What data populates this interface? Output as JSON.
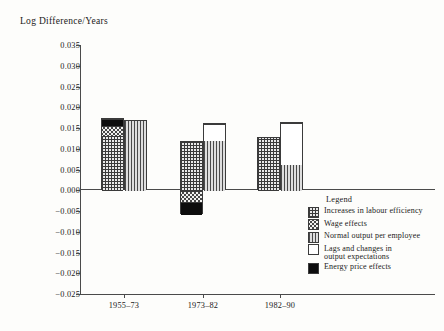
{
  "chart_data": {
    "type": "bar",
    "title": "Log Difference/Years",
    "subtitle": "",
    "xlabel": "",
    "ylabel": "Log Difference/Years",
    "grid": false,
    "stacked": true,
    "legend_position": "inside-bottom-right",
    "ylim": [
      -0.025,
      0.035
    ],
    "ytick_labels": [
      "0.035",
      "0.030",
      "0.025",
      "0.020",
      "0.015",
      "0.010",
      "0.005",
      "0.000",
      "−0.005",
      "−0.010",
      "−0.015",
      "−0.020",
      "−0.025"
    ],
    "ytick_values": [
      0.035,
      0.03,
      0.025,
      0.02,
      0.015,
      0.01,
      0.005,
      0.0,
      -0.005,
      -0.01,
      -0.015,
      -0.02,
      -0.025
    ],
    "categories": [
      "1955–73",
      "1973–82",
      "1982–90"
    ],
    "series": [
      {
        "name": "Increases in labour efficiency",
        "pattern": "grid",
        "values": [
          0.0133,
          0.0118,
          0.0128
        ]
      },
      {
        "name": "Wage effects",
        "pattern": "dots",
        "values": [
          0.0024,
          -0.0027,
          0.0
        ]
      },
      {
        "name": "Normal output per employee",
        "pattern": "vertical-lines",
        "values": [
          0.017,
          0.012,
          0.0063
        ]
      },
      {
        "name": "Lags and changes in output expectations",
        "pattern": "white",
        "values": [
          0.0,
          0.0043,
          0.0102
        ]
      },
      {
        "name": "Energy price effects",
        "pattern": "black",
        "values": [
          0.0018,
          -0.003,
          0.0
        ]
      }
    ],
    "bars": [
      {
        "group": "1955–73",
        "left_bar": {
          "segments": [
            {
              "series": "Increases in labour efficiency",
              "from": 0.0,
              "to": 0.0133
            },
            {
              "series": "Wage effects",
              "from": 0.0133,
              "to": 0.0157
            },
            {
              "series": "Energy price effects",
              "from": 0.0157,
              "to": 0.0175
            }
          ]
        },
        "right_bar": {
          "segments": [
            {
              "series": "Normal output per employee",
              "from": 0.0,
              "to": 0.017
            }
          ]
        }
      },
      {
        "group": "1973–82",
        "left_bar": {
          "segments": [
            {
              "series": "Increases in labour efficiency",
              "from": 0.0,
              "to": 0.0118
            },
            {
              "series": "Wage effects",
              "from": -0.0027,
              "to": 0.0
            },
            {
              "series": "Energy price effects",
              "from": -0.0057,
              "to": -0.0027
            }
          ]
        },
        "right_bar": {
          "segments": [
            {
              "series": "Normal output per employee",
              "from": 0.0,
              "to": 0.012
            },
            {
              "series": "Lags and changes in output expectations",
              "from": 0.012,
              "to": 0.0163
            }
          ]
        }
      },
      {
        "group": "1982–90",
        "left_bar": {
          "segments": [
            {
              "series": "Increases in labour efficiency",
              "from": 0.0,
              "to": 0.0128
            }
          ]
        },
        "right_bar": {
          "segments": [
            {
              "series": "Normal output per employee",
              "from": 0.0,
              "to": 0.0063
            },
            {
              "series": "Lags and changes in output expectations",
              "from": 0.0063,
              "to": 0.0165
            }
          ]
        }
      }
    ]
  },
  "legend": {
    "title": "Legend",
    "items": [
      {
        "label": "Increases in labour efficiency",
        "line2": "",
        "pattern": "grid"
      },
      {
        "label": "Wage effects",
        "line2": "",
        "pattern": "dots"
      },
      {
        "label": "Normal output per employee",
        "line2": "",
        "pattern": "vertical-lines"
      },
      {
        "label": "Lags and changes in",
        "line2": "output expectations",
        "pattern": "white"
      },
      {
        "label": "Energy price effects",
        "line2": "",
        "pattern": "black"
      }
    ]
  },
  "axis": {
    "title": "Log Difference/Years",
    "ticks": [
      {
        "label": "0.035"
      },
      {
        "label": "0.030"
      },
      {
        "label": "0.025"
      },
      {
        "label": "0.020"
      },
      {
        "label": "0.015"
      },
      {
        "label": "0.010"
      },
      {
        "label": "0.005"
      },
      {
        "label": "0.000"
      },
      {
        "label": "−0.005"
      },
      {
        "label": "−0.010"
      },
      {
        "label": "−0.015"
      },
      {
        "label": "−0.020"
      },
      {
        "label": "−0.025"
      }
    ],
    "xticks": [
      {
        "label": "1955–73"
      },
      {
        "label": "1973–82"
      },
      {
        "label": "1982–90"
      }
    ]
  },
  "colors": {
    "axis": "#4a4a4a",
    "ink": "#1a1a1a",
    "background": "#fdfdfb",
    "black_fill": "#0d0d0d",
    "white_fill": "#ffffff"
  }
}
